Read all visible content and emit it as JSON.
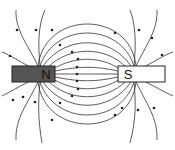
{
  "diagram": {
    "title": "",
    "type": "magnetic-field-lines",
    "colors": {
      "background": "#ffffff",
      "north_magnet": "#555555",
      "south_magnet": "#ffffff",
      "outline": "#222222",
      "field_line": "#333333"
    },
    "magnets": [
      {
        "id": "north",
        "label": "N",
        "x": 12,
        "y": 66,
        "width": 43,
        "height": 16,
        "fill": "#555555"
      },
      {
        "id": "south",
        "label": "S",
        "x": 118,
        "y": 66,
        "width": 47,
        "height": 16,
        "fill": "#ffffff"
      }
    ],
    "field_direction": "N to S",
    "inner_lines": [
      {
        "d": "M55,74 C80,74 95,74 118,74",
        "arrow": [
          77,
          74
        ]
      },
      {
        "d": "M55,71 C80,66 95,66 118,71",
        "arrow": [
          77,
          67
        ]
      },
      {
        "d": "M55,77 C80,82 95,82 118,77",
        "arrow": [
          77,
          81
        ]
      },
      {
        "d": "M53,69 C75,56 100,56 120,69",
        "arrow": [
          78,
          59
        ]
      },
      {
        "d": "M53,79 C75,92 100,92 120,79",
        "arrow": [
          78,
          89
        ]
      },
      {
        "d": "M48,67 C70,46 105,46 126,67",
        "arrow": [
          72,
          52
        ]
      },
      {
        "d": "M48,81 C70,102 105,102 126,81",
        "arrow": [
          72,
          96
        ]
      },
      {
        "d": "M43,66 C65,35 110,35 131,66",
        "arrow": [
          60,
          45
        ]
      },
      {
        "d": "M43,82 C65,113 110,113 131,82",
        "arrow": [
          60,
          103
        ]
      },
      {
        "d": "M40,66 C55,22 120,22 134,66",
        "arrow": [
          115,
          33
        ]
      },
      {
        "d": "M40,82 C55,126 120,126 134,82",
        "arrow": [
          115,
          115
        ]
      },
      {
        "d": "M38,66 C45,10 130,10 136,66",
        "arrow": [
          52,
          30
        ]
      },
      {
        "d": "M38,82 C45,138 130,138 136,82",
        "arrow": [
          52,
          120
        ]
      }
    ],
    "outer_lines": [
      {
        "d": "M38,66 C28,45 15,30 16,10",
        "arrow": [
          17,
          30
        ]
      },
      {
        "d": "M40,66 C38,45 38,25 45,10",
        "arrow": [
          36,
          30
        ]
      },
      {
        "d": "M36,70 C20,62 10,55 2,52",
        "arrow": [
          10,
          56
        ]
      },
      {
        "d": "M38,82 C28,103 15,118 16,140",
        "arrow": [
          13,
          100
        ]
      },
      {
        "d": "M40,82 C38,103 38,120 42,143",
        "arrow": [
          23,
          97
        ]
      },
      {
        "d": "M36,78 C20,86 10,92 2,96",
        "arrow": [
          35,
          102
        ]
      },
      {
        "d": "M136,66 C146,45 158,30 157,10",
        "arrow": [
          152,
          38
        ]
      },
      {
        "d": "M134,66 C136,45 136,25 130,10",
        "arrow": [
          139,
          30
        ]
      },
      {
        "d": "M138,70 C154,62 164,55 173,52",
        "arrow": [
          162,
          55
        ]
      },
      {
        "d": "M136,82 C146,103 158,118 157,140",
        "arrow": [
          154,
          108
        ]
      },
      {
        "d": "M134,82 C136,103 136,120 130,143",
        "arrow": [
          138,
          110
        ]
      },
      {
        "d": "M138,78 C154,86 164,92 173,96",
        "arrow": [
          122,
          108
        ]
      }
    ]
  }
}
